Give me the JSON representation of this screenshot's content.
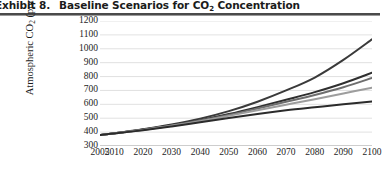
{
  "figure": {
    "exhibit_label": "Exhibit 8.",
    "title": "Baseline Scenarios for CO",
    "title_sub": "2",
    "title_tail": " Concentration"
  },
  "axes": {
    "ylabel_main": "Atmospheric CO",
    "ylabel_sub": "2",
    "ylabel_tail": " (ppm)",
    "yticks": [
      "1200",
      "1100",
      "1000",
      "900",
      "800",
      "700",
      "600",
      "500",
      "400",
      "300"
    ],
    "xticks": [
      "2005",
      "2010",
      "2020",
      "2030",
      "2040",
      "2050",
      "2060",
      "2070",
      "2080",
      "2090",
      "2100"
    ]
  },
  "colors": {
    "grid": "#d9d9d9",
    "axis": "#9a9a9a",
    "dark": "#333333",
    "dark2": "#3f3f3f",
    "mid": "#6e6e6e",
    "light": "#9d9d9d",
    "near_black": "#2b2b2b",
    "rule": "#4a4a4a"
  },
  "chart_data": {
    "type": "line",
    "xlabel": "",
    "ylabel": "Atmospheric CO2 (ppm)",
    "xlim": [
      2005,
      2100
    ],
    "ylim": [
      300,
      1200
    ],
    "ytick_step": 100,
    "grid": "horizontal",
    "legend": "none",
    "x": [
      2005,
      2010,
      2020,
      2030,
      2040,
      2050,
      2060,
      2070,
      2080,
      2090,
      2100
    ],
    "series": [
      {
        "name": "Scenario A (highest)",
        "color": "#3a3a3a",
        "values": [
          380,
          392,
          421,
          455,
          497,
          551,
          619,
          700,
          793,
          920,
          1068
        ]
      },
      {
        "name": "Scenario B",
        "color": "#2f2f2f",
        "values": [
          380,
          391,
          418,
          449,
          486,
          530,
          580,
          633,
          688,
          752,
          828
        ]
      },
      {
        "name": "Scenario C",
        "color": "#6e6e6e",
        "values": [
          380,
          391,
          417,
          447,
          483,
          524,
          570,
          618,
          667,
          723,
          790
        ]
      },
      {
        "name": "Scenario D",
        "color": "#9d9d9d",
        "values": [
          380,
          390,
          416,
          445,
          479,
          517,
          557,
          597,
          637,
          678,
          720
        ]
      },
      {
        "name": "Scenario E (lowest)",
        "color": "#2b2b2b",
        "values": [
          380,
          390,
          414,
          441,
          471,
          502,
          531,
          557,
          579,
          600,
          620
        ]
      }
    ]
  }
}
